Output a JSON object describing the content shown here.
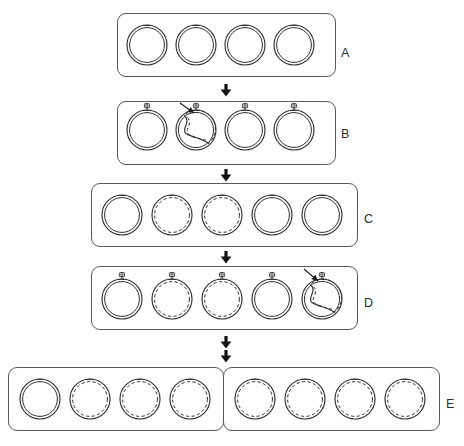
{
  "figure": {
    "background": "#ffffff",
    "line_color": "#2e2e2e",
    "box_color": "#5a5a5a",
    "arrow_color": "#141414",
    "width": 464,
    "height": 446
  },
  "rows": [
    {
      "id": "A",
      "label": "A",
      "label_x": 341,
      "label_y": 47,
      "boxes": [
        {
          "x": 117,
          "y": 13,
          "w": 219,
          "h": 64
        }
      ],
      "circles": [
        {
          "cx": 147,
          "cy": 45,
          "r": 20,
          "dashed": false,
          "ori": false,
          "theta": false
        },
        {
          "cx": 196,
          "cy": 45,
          "r": 20,
          "dashed": false,
          "ori": false,
          "theta": false
        },
        {
          "cx": 245,
          "cy": 45,
          "r": 20,
          "dashed": false,
          "ori": false,
          "theta": false
        },
        {
          "cx": 294,
          "cy": 45,
          "r": 20,
          "dashed": false,
          "ori": false,
          "theta": false
        }
      ],
      "pointers": []
    },
    {
      "id": "B",
      "label": "B",
      "label_x": 341,
      "label_y": 128,
      "boxes": [
        {
          "x": 117,
          "y": 101,
          "w": 219,
          "h": 64
        }
      ],
      "circles": [
        {
          "cx": 147,
          "cy": 130,
          "r": 20,
          "dashed": false,
          "ori": true,
          "theta": false
        },
        {
          "cx": 196,
          "cy": 130,
          "r": 20,
          "dashed": false,
          "ori": true,
          "theta": true
        },
        {
          "cx": 245,
          "cy": 130,
          "r": 20,
          "dashed": false,
          "ori": true,
          "theta": false
        },
        {
          "cx": 294,
          "cy": 130,
          "r": 20,
          "dashed": false,
          "ori": true,
          "theta": false
        }
      ],
      "pointers": [
        {
          "from_x": 180,
          "from_y": 103,
          "to_x": 194,
          "to_y": 113
        }
      ]
    },
    {
      "id": "C",
      "label": "C",
      "label_x": 364,
      "label_y": 213,
      "boxes": [
        {
          "x": 91,
          "y": 183,
          "w": 267,
          "h": 64
        }
      ],
      "circles": [
        {
          "cx": 122,
          "cy": 215,
          "r": 20,
          "dashed": false,
          "ori": false,
          "theta": false
        },
        {
          "cx": 172,
          "cy": 215,
          "r": 20,
          "dashed": true,
          "ori": false,
          "theta": false
        },
        {
          "cx": 222,
          "cy": 215,
          "r": 20,
          "dashed": true,
          "ori": false,
          "theta": false
        },
        {
          "cx": 272,
          "cy": 215,
          "r": 20,
          "dashed": false,
          "ori": false,
          "theta": false
        },
        {
          "cx": 322,
          "cy": 215,
          "r": 20,
          "dashed": false,
          "ori": false,
          "theta": false
        }
      ],
      "pointers": []
    },
    {
      "id": "D",
      "label": "D",
      "label_x": 364,
      "label_y": 297,
      "boxes": [
        {
          "x": 91,
          "y": 266,
          "w": 267,
          "h": 64
        }
      ],
      "circles": [
        {
          "cx": 122,
          "cy": 299,
          "r": 20,
          "dashed": false,
          "ori": true,
          "theta": false
        },
        {
          "cx": 172,
          "cy": 299,
          "r": 20,
          "dashed": true,
          "ori": true,
          "theta": false
        },
        {
          "cx": 222,
          "cy": 299,
          "r": 20,
          "dashed": true,
          "ori": true,
          "theta": false
        },
        {
          "cx": 272,
          "cy": 299,
          "r": 20,
          "dashed": false,
          "ori": true,
          "theta": false
        },
        {
          "cx": 322,
          "cy": 299,
          "r": 20,
          "dashed": false,
          "ori": true,
          "theta": true
        }
      ],
      "pointers": [
        {
          "from_x": 304,
          "from_y": 269,
          "to_x": 318,
          "to_y": 281
        }
      ]
    },
    {
      "id": "E",
      "label": "E",
      "label_x": 446,
      "label_y": 398,
      "boxes": [
        {
          "x": 8,
          "y": 367,
          "w": 216,
          "h": 64
        },
        {
          "x": 223,
          "y": 367,
          "w": 217,
          "h": 64
        }
      ],
      "circles": [
        {
          "cx": 40,
          "cy": 399,
          "r": 20,
          "dashed": false,
          "ori": false,
          "theta": false
        },
        {
          "cx": 90,
          "cy": 399,
          "r": 20,
          "dashed": true,
          "ori": false,
          "theta": false
        },
        {
          "cx": 140,
          "cy": 399,
          "r": 20,
          "dashed": true,
          "ori": false,
          "theta": false
        },
        {
          "cx": 190,
          "cy": 399,
          "r": 20,
          "dashed": true,
          "ori": false,
          "theta": false
        },
        {
          "cx": 255,
          "cy": 399,
          "r": 20,
          "dashed": true,
          "ori": false,
          "theta": false
        },
        {
          "cx": 305,
          "cy": 399,
          "r": 20,
          "dashed": true,
          "ori": false,
          "theta": false
        },
        {
          "cx": 355,
          "cy": 399,
          "r": 20,
          "dashed": true,
          "ori": false,
          "theta": false
        },
        {
          "cx": 405,
          "cy": 399,
          "r": 20,
          "dashed": true,
          "ori": false,
          "theta": false
        }
      ],
      "pointers": []
    }
  ],
  "arrows": [
    {
      "id": "arrow-a-b",
      "x": 226,
      "y": 84,
      "direction": "down"
    },
    {
      "id": "arrow-b-c",
      "x": 226,
      "y": 169,
      "direction": "down"
    },
    {
      "id": "arrow-c-d",
      "x": 226,
      "y": 251,
      "direction": "down"
    },
    {
      "id": "arrow-d-e1",
      "x": 226,
      "y": 336,
      "direction": "down"
    },
    {
      "id": "arrow-d-e2",
      "x": 226,
      "y": 350,
      "direction": "down"
    }
  ]
}
